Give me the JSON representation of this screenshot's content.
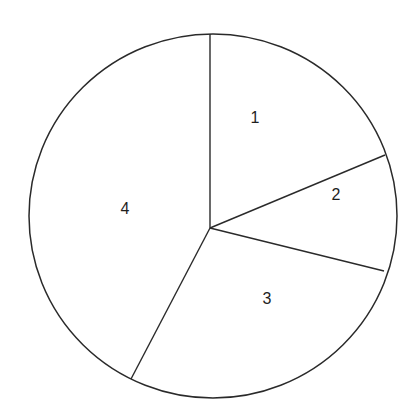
{
  "chart_data": {
    "type": "pie",
    "title": "",
    "categories": [
      "1",
      "2",
      "3",
      "4"
    ],
    "values": [
      18.7,
      10.1,
      28.8,
      42.4
    ],
    "start_angle_deg": 90,
    "direction": "clockwise",
    "legend": "none",
    "labels_inside": true
  },
  "geometry": {
    "outline": {
      "cx": 213,
      "cy": 216,
      "rx": 184,
      "ry": 182
    },
    "vertex": {
      "x": 210,
      "y": 228
    },
    "spokes": [
      {
        "x": 210,
        "y": 34
      },
      {
        "x": 385,
        "y": 155
      },
      {
        "x": 384,
        "y": 271
      },
      {
        "x": 131,
        "y": 379
      }
    ],
    "label_positions": [
      {
        "x": 255,
        "y": 119
      },
      {
        "x": 336,
        "y": 196
      },
      {
        "x": 267,
        "y": 300
      },
      {
        "x": 125,
        "y": 210
      }
    ]
  },
  "colors": {
    "line": "#2a2a2a",
    "fill": "#ffffff",
    "text": "#1e1e1e"
  }
}
